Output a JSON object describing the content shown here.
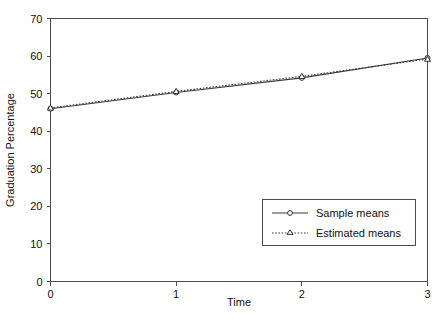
{
  "chart_data": {
    "type": "line",
    "title": "",
    "xlabel": "Time",
    "ylabel": "Graduation Percentage",
    "x": [
      0,
      1,
      2,
      3
    ],
    "xticklabels": [
      "0",
      "1",
      "2",
      "3"
    ],
    "yticks": [
      0,
      10,
      20,
      30,
      40,
      50,
      60,
      70
    ],
    "yticklabels": [
      "0",
      "10",
      "20",
      "30",
      "40",
      "50",
      "60",
      "70"
    ],
    "xlim": [
      0,
      3
    ],
    "ylim": [
      0,
      70
    ],
    "grid": false,
    "legend_position": "center-right",
    "series": [
      {
        "name": "Sample means",
        "values": [
          46.0,
          50.3,
          54.2,
          59.5
        ],
        "linestyle": "solid",
        "marker": "open-circle",
        "color": "#3a3a3a"
      },
      {
        "name": "Estimated means",
        "values": [
          46.2,
          50.6,
          54.6,
          59.2
        ],
        "linestyle": "dotted",
        "marker": "triangle",
        "color": "#3a3a3a"
      }
    ]
  },
  "legend": {
    "entries": [
      {
        "label": "Sample means"
      },
      {
        "label": "Estimated means"
      }
    ]
  },
  "colors": {
    "axis": "#4d4d4d",
    "text": "#111111",
    "series": "#3a3a3a",
    "background": "#ffffff"
  }
}
